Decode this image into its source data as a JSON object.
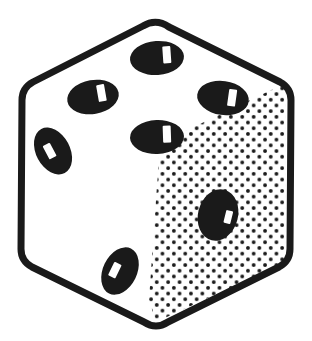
{
  "image": {
    "kind": "line-art-illustration",
    "subject": "dice",
    "title": "Isometric die showing five pips on the top face and one pip on the shaded right face",
    "background_color": "#ffffff",
    "ink_color": "#1a1a1a",
    "width": 312,
    "height": 341
  },
  "die": {
    "outline": {
      "stroke_color": "#1a1a1a",
      "stroke_width": 7,
      "corner_radius": 18,
      "vertices": [
        {
          "name": "top",
          "x": 156,
          "y": 23
        },
        {
          "name": "upper-right",
          "x": 289,
          "y": 88
        },
        {
          "name": "lower-right",
          "x": 286,
          "y": 262
        },
        {
          "name": "bottom",
          "x": 156,
          "y": 325
        },
        {
          "name": "lower-left",
          "x": 24,
          "y": 258
        },
        {
          "name": "upper-left",
          "x": 26,
          "y": 86
        }
      ],
      "interior_center_vertex": {
        "x": 160,
        "y": 143
      }
    },
    "faces": [
      {
        "name": "top-face",
        "fill": "#ffffff",
        "shading": "none",
        "pip_count": 5,
        "pips": [
          {
            "index": 1,
            "cx": 157,
            "cy": 58,
            "rx": 27,
            "ry": 17,
            "rotate": -4,
            "highlight": {
              "x": 163,
              "y": 47,
              "w": 8,
              "h": 17,
              "rotate": -4
            }
          },
          {
            "index": 2,
            "cx": 93,
            "cy": 97,
            "rx": 26,
            "ry": 17,
            "rotate": -10,
            "highlight": {
              "x": 98,
              "y": 86,
              "w": 8,
              "h": 17,
              "rotate": -10
            }
          },
          {
            "index": 3,
            "cx": 223,
            "cy": 98,
            "rx": 26,
            "ry": 17,
            "rotate": 8,
            "highlight": {
              "x": 228,
              "y": 88,
              "w": 8,
              "h": 17,
              "rotate": 8
            }
          },
          {
            "index": 4,
            "cx": 53,
            "cy": 151,
            "rx": 17,
            "ry": 25,
            "rotate": -28,
            "highlight": {
              "x": 46,
              "y": 142,
              "w": 8,
              "h": 15,
              "rotate": -28
            }
          },
          {
            "index": 5,
            "cx": 157,
            "cy": 137,
            "rx": 27,
            "ry": 17,
            "rotate": -2,
            "highlight": {
              "x": 163,
              "y": 126,
              "w": 8,
              "h": 17,
              "rotate": -2
            }
          }
        ]
      },
      {
        "name": "left-face",
        "fill": "#ffffff",
        "shading": "none",
        "pip_count": 1,
        "pips": [
          {
            "index": 1,
            "cx": 120,
            "cy": 271,
            "rx": 17,
            "ry": 25,
            "rotate": 26,
            "highlight": {
              "x": 111,
              "y": 265,
              "w": 8,
              "h": 15,
              "rotate": 26
            }
          }
        ]
      },
      {
        "name": "right-face",
        "fill": "#ffffff",
        "shading": "halftone-dots",
        "dot_color": "#1a1a1a",
        "dot_radius": 1.9,
        "dot_spacing": 11.4,
        "pip_count": 1,
        "pips": [
          {
            "index": 1,
            "cx": 218,
            "cy": 215,
            "rx": 20,
            "ry": 26,
            "rotate": 14,
            "highlight": {
              "x": 225,
              "y": 208,
              "w": 7,
              "h": 13,
              "rotate": 14
            }
          }
        ]
      }
    ],
    "visible_value_total": 7
  }
}
